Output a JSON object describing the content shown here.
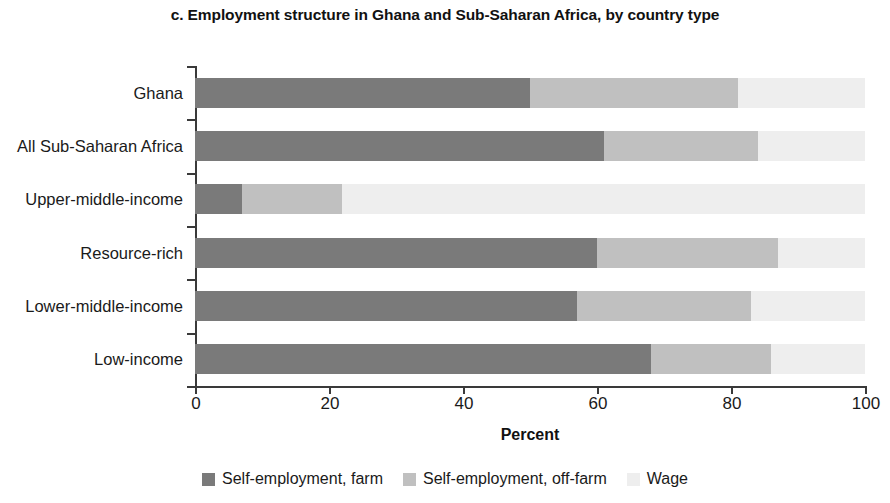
{
  "chart_data": {
    "type": "bar",
    "orientation": "horizontal",
    "stacked": true,
    "title": "c. Employment structure in Ghana and Sub-Saharan Africa, by country type",
    "xlabel": "Percent",
    "ylabel": "",
    "xlim": [
      0,
      100
    ],
    "xticks": [
      0,
      20,
      40,
      60,
      80,
      100
    ],
    "grid": false,
    "legend_position": "bottom",
    "categories": [
      "Ghana",
      "All Sub-Saharan Africa",
      "Upper-middle-income",
      "Resource-rich",
      "Lower-middle-income",
      "Low-income"
    ],
    "series": [
      {
        "name": "Self-employment, farm",
        "color": "#7a7a7a",
        "values": [
          50,
          61,
          7,
          60,
          57,
          68
        ]
      },
      {
        "name": "Self-employment, off-farm",
        "color": "#c0c0c0",
        "values": [
          31,
          23,
          15,
          27,
          26,
          18
        ]
      },
      {
        "name": "Wage",
        "color": "#eeeeee",
        "values": [
          19,
          16,
          78,
          13,
          17,
          14
        ]
      }
    ]
  },
  "legend": {
    "items": [
      {
        "label": "Self-employment, farm",
        "color": "#7a7a7a"
      },
      {
        "label": "Self-employment, off-farm",
        "color": "#c0c0c0"
      },
      {
        "label": "Wage",
        "color": "#eeeeee"
      }
    ]
  }
}
